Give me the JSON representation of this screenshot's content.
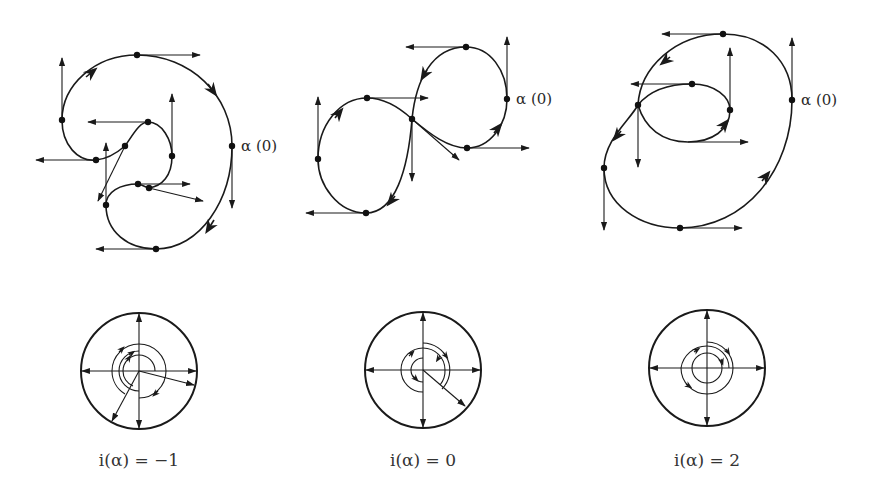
{
  "figures": [
    {
      "id": "curve-1",
      "start_label": "α (0)",
      "rotation_index_caption": "i(α) = −1",
      "rotation_index": -1
    },
    {
      "id": "curve-2",
      "start_label": "α (0)",
      "rotation_index_caption": "i(α) = 0",
      "rotation_index": 0
    },
    {
      "id": "curve-3",
      "start_label": "α (0)",
      "rotation_index_caption": "i(α) = 2",
      "rotation_index": 2
    }
  ],
  "colors": {
    "ink": "#1a1a1a",
    "background": "#ffffff"
  }
}
